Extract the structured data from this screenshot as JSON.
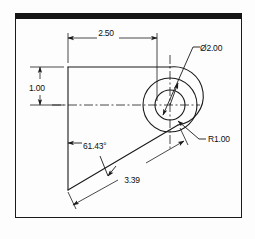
{
  "drawing": {
    "title": "Mechanical part orthographic dimension drawing",
    "background_color": "#fdfdfd",
    "line_color": "#1a1a1a",
    "banner_color": "#151515",
    "frame": {
      "x": 15,
      "y": 13,
      "width": 227,
      "height": 205
    },
    "dimensions": [
      {
        "id": "width-dimension",
        "label": "2.50",
        "type": "linear-horizontal",
        "value": 2.5,
        "text_x": 106,
        "text_y": 36
      },
      {
        "id": "height-dimension",
        "label": "1.00",
        "type": "linear-vertical",
        "value": 1.0,
        "text_x": 29,
        "text_y": 91
      },
      {
        "id": "diameter-callout",
        "label": "Ø2.00",
        "type": "diameter",
        "value": 2.0,
        "text_x": 196,
        "text_y": 51
      },
      {
        "id": "radius-callout",
        "label": "R1.00",
        "type": "radius",
        "value": 1.0,
        "text_x": 209,
        "text_y": 142
      },
      {
        "id": "angle-dimension",
        "label": "61.43°",
        "type": "angular",
        "value": 61.43,
        "text_x": 83,
        "text_y": 149
      },
      {
        "id": "slant-length-dimension",
        "label": "3.39",
        "type": "linear-aligned",
        "value": 3.39,
        "text_x": 132,
        "text_y": 183
      }
    ]
  }
}
